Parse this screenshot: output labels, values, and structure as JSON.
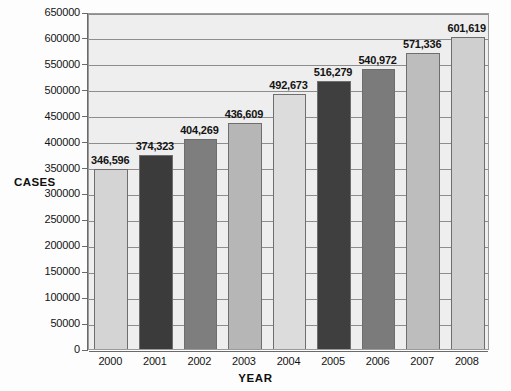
{
  "chart_data": {
    "type": "bar",
    "title": "",
    "xlabel": "YEAR",
    "ylabel": "CASES",
    "categories": [
      "2000",
      "2001",
      "2002",
      "2003",
      "2004",
      "2005",
      "2006",
      "2007",
      "2008"
    ],
    "values": [
      346596,
      374323,
      404269,
      436609,
      492673,
      516279,
      540972,
      571336,
      601619
    ],
    "value_labels": [
      "346,596",
      "374,323",
      "404,269",
      "436,609",
      "492,673",
      "516,279",
      "540,972",
      "571,336",
      "601,619"
    ],
    "bar_colors": [
      "#d4d4d4",
      "#3b3b3b",
      "#7e7e7e",
      "#b6b6b6",
      "#dcdcdc",
      "#3f3f3f",
      "#7b7b7b",
      "#bdbdbd",
      "#cfcfcf"
    ],
    "ylim": [
      0,
      650000
    ],
    "ytick_step": 50000,
    "ytick_labels": [
      "650000",
      "600000",
      "550000",
      "500000",
      "450000",
      "400000",
      "350000",
      "300000",
      "250000",
      "200000",
      "150000",
      "100000",
      "50000",
      "0"
    ],
    "ytick_values": [
      650000,
      600000,
      550000,
      500000,
      450000,
      400000,
      350000,
      300000,
      250000,
      200000,
      150000,
      100000,
      50000,
      0
    ],
    "grid": true,
    "legend": null,
    "plot_background": "#eeeeee",
    "grid_color": "#8d8d8d",
    "axis_color": "#6a6a6a"
  }
}
